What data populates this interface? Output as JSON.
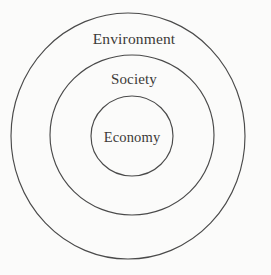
{
  "diagram": {
    "type": "nested-circles",
    "background_color": "#fbfbfa",
    "stroke_color": "#4a4a4a",
    "text_color": "#3c3a38",
    "rings": [
      {
        "id": "environment",
        "label": "Environment",
        "level": 1,
        "center_x": 128,
        "center_y": 136,
        "radius_x": 117,
        "radius_y": 123,
        "label_x": 134,
        "label_y": 39
      },
      {
        "id": "society",
        "label": "Society",
        "level": 2,
        "center_x": 132,
        "center_y": 135,
        "radius_x": 82,
        "radius_y": 80,
        "label_x": 134,
        "label_y": 79
      },
      {
        "id": "economy",
        "label": "Economy",
        "level": 3,
        "center_x": 132,
        "center_y": 136,
        "radius_x": 41,
        "radius_y": 40,
        "label_x": 132,
        "label_y": 137
      }
    ]
  }
}
